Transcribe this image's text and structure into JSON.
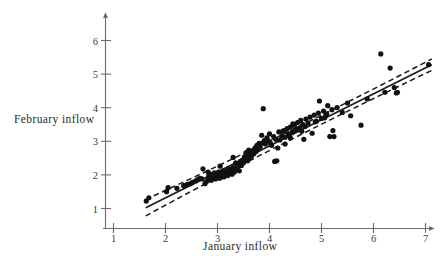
{
  "chart_data": {
    "type": "scatter",
    "title": "",
    "xlabel": "January inflow",
    "ylabel": "February inflow",
    "xlim": [
      0.72,
      7.62
    ],
    "ylim": [
      0.55,
      6.45
    ],
    "xticks": [
      1,
      2,
      3,
      4,
      5,
      6,
      7
    ],
    "yticks": [
      1,
      2,
      3,
      4,
      5,
      6
    ],
    "xtick_labels": [
      "1",
      "2",
      "3",
      "4",
      "5",
      "6",
      "7"
    ],
    "ytick_labels": [
      "1",
      "2",
      "3",
      "4",
      "5",
      "6"
    ],
    "grid": false,
    "legend": null,
    "axis_style": "arrow-ended-single-axes",
    "point_color": "#111111",
    "line_color": "#1a1a1a",
    "band_color": "#1a1a1a",
    "axis_color": "#6b6b6b",
    "point_radius": 2.6,
    "series": [
      {
        "name": "observations",
        "marker": "filled-circle",
        "x": [
          1.63,
          1.68,
          2.02,
          2.05,
          2.22,
          2.35,
          2.42,
          2.48,
          2.52,
          2.58,
          2.62,
          2.66,
          2.7,
          2.72,
          2.76,
          2.79,
          2.82,
          2.84,
          2.86,
          2.88,
          2.9,
          2.92,
          2.94,
          2.96,
          2.98,
          3.0,
          3.02,
          3.04,
          3.06,
          3.08,
          3.1,
          3.12,
          3.14,
          3.16,
          3.18,
          3.2,
          3.22,
          3.24,
          3.26,
          3.28,
          3.3,
          3.32,
          3.34,
          3.36,
          3.38,
          3.4,
          3.42,
          3.44,
          3.46,
          3.48,
          3.5,
          3.52,
          3.54,
          3.56,
          3.58,
          3.6,
          3.62,
          3.64,
          3.66,
          3.68,
          3.7,
          3.72,
          3.74,
          3.76,
          3.78,
          3.8,
          3.82,
          3.85,
          3.88,
          3.9,
          3.92,
          3.95,
          3.98,
          4.0,
          4.04,
          4.08,
          4.1,
          4.14,
          4.18,
          4.2,
          4.24,
          4.28,
          4.3,
          4.34,
          4.36,
          4.4,
          4.44,
          4.48,
          4.5,
          4.54,
          4.58,
          4.6,
          4.64,
          4.66,
          4.7,
          4.74,
          4.78,
          4.82,
          4.86,
          4.9,
          4.94,
          4.96,
          5.0,
          5.04,
          5.08,
          5.12,
          5.16,
          5.2,
          5.24,
          5.3,
          5.4,
          5.5,
          5.56,
          5.76,
          5.88,
          6.14,
          6.22,
          6.32,
          6.4,
          6.44,
          6.46,
          7.06,
          2.82,
          3.05,
          3.3,
          3.55,
          3.88,
          4.12,
          4.16,
          4.45,
          4.62,
          4.88,
          5.06,
          5.22,
          3.12,
          3.42,
          3.68,
          4.02,
          4.3,
          4.55,
          2.88,
          3.22,
          3.6,
          3.96,
          4.26,
          4.68,
          5.1,
          3.35,
          3.75,
          4.4
        ],
        "y": [
          1.22,
          1.32,
          1.5,
          1.62,
          1.6,
          1.68,
          1.72,
          1.74,
          1.78,
          1.82,
          1.86,
          1.9,
          1.88,
          2.18,
          1.74,
          1.8,
          1.92,
          1.98,
          2.02,
          1.84,
          1.96,
          2.02,
          2.06,
          1.88,
          1.94,
          2.0,
          2.08,
          1.9,
          1.96,
          2.04,
          2.1,
          1.94,
          2.0,
          2.06,
          2.12,
          1.98,
          2.04,
          2.1,
          2.16,
          2.02,
          2.22,
          2.08,
          2.14,
          2.34,
          2.2,
          2.26,
          2.12,
          2.4,
          2.28,
          2.44,
          2.36,
          2.54,
          2.48,
          2.58,
          2.42,
          2.62,
          2.52,
          2.68,
          2.58,
          2.72,
          2.64,
          2.8,
          2.7,
          2.88,
          2.76,
          2.94,
          2.84,
          3.18,
          3.97,
          3.02,
          2.92,
          3.1,
          3.0,
          3.22,
          2.88,
          3.14,
          2.4,
          2.42,
          3.28,
          3.04,
          3.16,
          3.32,
          2.92,
          3.38,
          3.22,
          3.42,
          3.28,
          3.48,
          3.34,
          3.56,
          3.4,
          3.62,
          3.5,
          3.06,
          3.66,
          3.54,
          3.72,
          3.24,
          3.78,
          3.6,
          3.84,
          4.2,
          3.68,
          3.9,
          3.76,
          4.06,
          3.14,
          3.94,
          3.14,
          4.0,
          3.86,
          4.14,
          3.76,
          3.48,
          4.26,
          5.6,
          4.46,
          5.18,
          4.6,
          4.44,
          4.46,
          5.28,
          2.08,
          2.26,
          2.52,
          2.66,
          2.96,
          3.06,
          2.8,
          3.52,
          3.3,
          3.58,
          3.7,
          3.32,
          2.12,
          2.3,
          2.62,
          2.94,
          3.12,
          3.36,
          1.86,
          2.18,
          2.74,
          3.04,
          3.3,
          3.44,
          3.82,
          2.36,
          2.84,
          3.1
        ]
      }
    ],
    "fit_line": {
      "name": "least-squares regression line",
      "style": "solid",
      "x_start": 1.62,
      "x_end": 7.12,
      "y_start": 1.02,
      "y_end": 5.28,
      "slope": 0.7745,
      "intercept": -0.2349
    },
    "confidence_bands": {
      "name": "confidence interval bands",
      "style": "dashed",
      "upper": {
        "x_start": 1.62,
        "y_start": 1.27,
        "x_mid": 4.0,
        "y_mid": 2.94,
        "x_end": 7.12,
        "y_end": 5.45
      },
      "lower": {
        "x_start": 1.62,
        "y_start": 0.78,
        "x_mid": 4.0,
        "y_mid": 2.8,
        "x_end": 7.12,
        "y_end": 5.11
      }
    }
  }
}
